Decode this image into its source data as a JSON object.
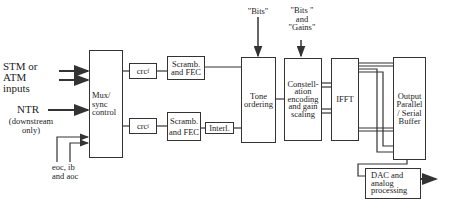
{
  "diagram": {
    "inputs": {
      "stm_atm": [
        "STM or",
        "ATM",
        "inputs"
      ],
      "ntr": "NTR",
      "ntr_note": [
        "(downstream",
        "only)"
      ],
      "eoc": [
        "eoc, ib",
        "and aoc"
      ]
    },
    "blocks": {
      "mux": [
        "Mux/",
        "sync",
        "control"
      ],
      "crc_f": {
        "base": "crc",
        "sub": "f"
      },
      "crc_i": {
        "base": "crc",
        "sub": "i"
      },
      "scramb_fast": [
        "Scramb.",
        "and FEC"
      ],
      "scramb_interleaved": [
        "Scramb.",
        "and FEC"
      ],
      "interleaver": "Interl.",
      "tone_ordering": [
        "Tone",
        "ordering"
      ],
      "constellation": [
        "Constell-",
        "ation",
        "encoding",
        "and gain",
        "scaling"
      ],
      "ifft": "IFFT",
      "output_buffer": [
        "Output",
        "Parallel",
        "/ Serial",
        "Buffer"
      ],
      "dac": [
        "DAC and",
        "analog",
        "processing"
      ]
    },
    "control_inputs": {
      "bits": "\"Bits\"",
      "bits_gains": [
        "\"Bits \"",
        "and",
        "\"Gains\""
      ]
    }
  }
}
